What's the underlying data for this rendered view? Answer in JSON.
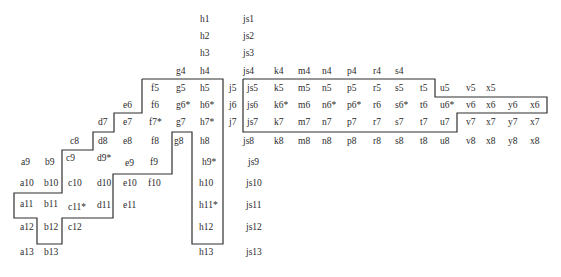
{
  "diagram": {
    "stroke_color": "#2f2f2f",
    "text_color": "#2a2a2a",
    "background": "#ffffff",
    "labels": [
      {
        "t": "h1",
        "x": 200,
        "y": 14
      },
      {
        "t": "js1",
        "x": 243,
        "y": 14
      },
      {
        "t": "h2",
        "x": 200,
        "y": 31
      },
      {
        "t": "js2",
        "x": 243,
        "y": 31
      },
      {
        "t": "h3",
        "x": 200,
        "y": 48
      },
      {
        "t": "js3",
        "x": 243,
        "y": 48
      },
      {
        "t": "g4",
        "x": 176,
        "y": 66
      },
      {
        "t": "h4",
        "x": 200,
        "y": 66
      },
      {
        "t": "js4",
        "x": 243,
        "y": 66
      },
      {
        "t": "k4",
        "x": 274,
        "y": 66
      },
      {
        "t": "m4",
        "x": 298,
        "y": 66
      },
      {
        "t": "n4",
        "x": 322,
        "y": 66
      },
      {
        "t": "p4",
        "x": 347,
        "y": 66
      },
      {
        "t": "r4",
        "x": 373,
        "y": 66
      },
      {
        "t": "s4",
        "x": 395,
        "y": 66
      },
      {
        "t": "f5",
        "x": 151,
        "y": 83
      },
      {
        "t": "g5",
        "x": 176,
        "y": 83
      },
      {
        "t": "h5",
        "x": 200,
        "y": 83
      },
      {
        "t": "j5",
        "x": 229,
        "y": 83
      },
      {
        "t": "js5",
        "x": 247,
        "y": 83
      },
      {
        "t": "k5",
        "x": 274,
        "y": 83
      },
      {
        "t": "m5",
        "x": 298,
        "y": 83
      },
      {
        "t": "n5",
        "x": 322,
        "y": 83
      },
      {
        "t": "p5",
        "x": 347,
        "y": 83
      },
      {
        "t": "r5",
        "x": 373,
        "y": 83
      },
      {
        "t": "s5",
        "x": 395,
        "y": 83
      },
      {
        "t": "t5",
        "x": 420,
        "y": 83
      },
      {
        "t": "u5",
        "x": 440,
        "y": 83
      },
      {
        "t": "v5",
        "x": 466,
        "y": 83
      },
      {
        "t": "x5",
        "x": 486,
        "y": 83
      },
      {
        "t": "e6",
        "x": 123,
        "y": 100
      },
      {
        "t": "f6",
        "x": 151,
        "y": 100
      },
      {
        "t": "g6*",
        "x": 176,
        "y": 100
      },
      {
        "t": "h6*",
        "x": 200,
        "y": 100
      },
      {
        "t": "j6",
        "x": 229,
        "y": 100
      },
      {
        "t": "js6",
        "x": 247,
        "y": 100
      },
      {
        "t": "k6*",
        "x": 274,
        "y": 100
      },
      {
        "t": "m6",
        "x": 298,
        "y": 100
      },
      {
        "t": "n6*",
        "x": 322,
        "y": 100
      },
      {
        "t": "p6*",
        "x": 347,
        "y": 100
      },
      {
        "t": "r6",
        "x": 373,
        "y": 100
      },
      {
        "t": "s6*",
        "x": 395,
        "y": 100
      },
      {
        "t": "t6",
        "x": 420,
        "y": 100
      },
      {
        "t": "u6*",
        "x": 440,
        "y": 100
      },
      {
        "t": "v6",
        "x": 466,
        "y": 100
      },
      {
        "t": "x6",
        "x": 486,
        "y": 100
      },
      {
        "t": "y6",
        "x": 508,
        "y": 100
      },
      {
        "t": "x6",
        "x": 530,
        "y": 100
      },
      {
        "t": "d7",
        "x": 98,
        "y": 117
      },
      {
        "t": "e7",
        "x": 123,
        "y": 117
      },
      {
        "t": "f7*",
        "x": 149,
        "y": 117
      },
      {
        "t": "g7",
        "x": 176,
        "y": 117
      },
      {
        "t": "h7*",
        "x": 200,
        "y": 117
      },
      {
        "t": "j7",
        "x": 229,
        "y": 117
      },
      {
        "t": "js7",
        "x": 247,
        "y": 117
      },
      {
        "t": "k7",
        "x": 274,
        "y": 117
      },
      {
        "t": "m7",
        "x": 298,
        "y": 117
      },
      {
        "t": "n7",
        "x": 322,
        "y": 117
      },
      {
        "t": "p7",
        "x": 347,
        "y": 117
      },
      {
        "t": "r7",
        "x": 373,
        "y": 117
      },
      {
        "t": "s7",
        "x": 395,
        "y": 117
      },
      {
        "t": "t7",
        "x": 420,
        "y": 117
      },
      {
        "t": "u7",
        "x": 440,
        "y": 117
      },
      {
        "t": "v7",
        "x": 466,
        "y": 117
      },
      {
        "t": "x7",
        "x": 486,
        "y": 117
      },
      {
        "t": "y7",
        "x": 508,
        "y": 117
      },
      {
        "t": "x7",
        "x": 530,
        "y": 117
      },
      {
        "t": "c8",
        "x": 70,
        "y": 136
      },
      {
        "t": "d8",
        "x": 98,
        "y": 136
      },
      {
        "t": "e8",
        "x": 123,
        "y": 136
      },
      {
        "t": "f8",
        "x": 151,
        "y": 136
      },
      {
        "t": "g8",
        "x": 174,
        "y": 136
      },
      {
        "t": "h8",
        "x": 200,
        "y": 136
      },
      {
        "t": "js8",
        "x": 243,
        "y": 136
      },
      {
        "t": "k8",
        "x": 274,
        "y": 136
      },
      {
        "t": "m8",
        "x": 298,
        "y": 136
      },
      {
        "t": "n8",
        "x": 322,
        "y": 136
      },
      {
        "t": "p8",
        "x": 347,
        "y": 136
      },
      {
        "t": "r8",
        "x": 373,
        "y": 136
      },
      {
        "t": "s8",
        "x": 395,
        "y": 136
      },
      {
        "t": "t8",
        "x": 420,
        "y": 136
      },
      {
        "t": "u8",
        "x": 440,
        "y": 136
      },
      {
        "t": "v8",
        "x": 466,
        "y": 136
      },
      {
        "t": "x8",
        "x": 486,
        "y": 136
      },
      {
        "t": "y8",
        "x": 508,
        "y": 136
      },
      {
        "t": "x8",
        "x": 530,
        "y": 136
      },
      {
        "t": "a9",
        "x": 21,
        "y": 157
      },
      {
        "t": "b9",
        "x": 45,
        "y": 157
      },
      {
        "t": "c9",
        "x": 66,
        "y": 153
      },
      {
        "t": "d9*",
        "x": 97,
        "y": 153
      },
      {
        "t": "e9",
        "x": 125,
        "y": 158
      },
      {
        "t": "f9",
        "x": 150,
        "y": 157
      },
      {
        "t": "h9*",
        "x": 202,
        "y": 157
      },
      {
        "t": "js9",
        "x": 248,
        "y": 157
      },
      {
        "t": "a10",
        "x": 20,
        "y": 178
      },
      {
        "t": "b10",
        "x": 44,
        "y": 178
      },
      {
        "t": "c10",
        "x": 68,
        "y": 178
      },
      {
        "t": "d10",
        "x": 97,
        "y": 178
      },
      {
        "t": "e10",
        "x": 123,
        "y": 178
      },
      {
        "t": "f10",
        "x": 148,
        "y": 178
      },
      {
        "t": "h10",
        "x": 199,
        "y": 178
      },
      {
        "t": "js10",
        "x": 246,
        "y": 178
      },
      {
        "t": "a11",
        "x": 20,
        "y": 199
      },
      {
        "t": "b11",
        "x": 44,
        "y": 199
      },
      {
        "t": "c11*",
        "x": 68,
        "y": 202
      },
      {
        "t": "d11",
        "x": 97,
        "y": 200
      },
      {
        "t": "e11",
        "x": 123,
        "y": 200
      },
      {
        "t": "h11*",
        "x": 199,
        "y": 200
      },
      {
        "t": "js11",
        "x": 246,
        "y": 200
      },
      {
        "t": "a12",
        "x": 20,
        "y": 222
      },
      {
        "t": "b12",
        "x": 44,
        "y": 222
      },
      {
        "t": "c12",
        "x": 68,
        "y": 222
      },
      {
        "t": "h12",
        "x": 199,
        "y": 222
      },
      {
        "t": "js12",
        "x": 246,
        "y": 222
      },
      {
        "t": "a13",
        "x": 20,
        "y": 247
      },
      {
        "t": "b13",
        "x": 44,
        "y": 247
      },
      {
        "t": "h13",
        "x": 199,
        "y": 247
      },
      {
        "t": "js13",
        "x": 246,
        "y": 247
      }
    ],
    "outlines": [
      {
        "name": "left-region-outline",
        "points": "142,79 223,79 223,244 192,244 192,132 172,132 172,174 113,174 113,218 62,218 62,244 37,244 37,218 14,218 14,193 62,193 62,150 93,150 93,132 114,132 114,113 142,113 142,79"
      },
      {
        "name": "right-region-outline",
        "points": "243,79 435,79 435,97 547,97 547,113 457,113 457,132 243,132 243,79"
      }
    ]
  }
}
